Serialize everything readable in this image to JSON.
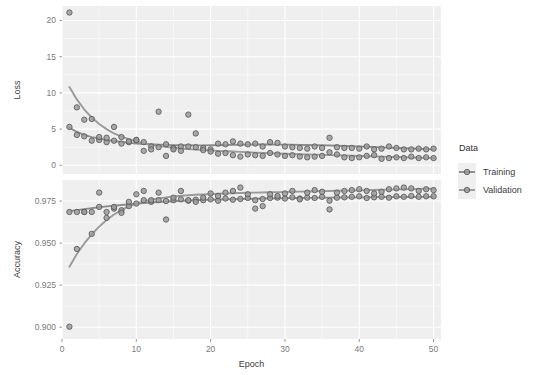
{
  "chart_data": {
    "type": "scatter",
    "title": "",
    "subtitle": "",
    "xlabel": "Epoch",
    "grid": true,
    "legend_position": "right",
    "legend_title": "Data",
    "series_names": [
      "Training",
      "Validation"
    ],
    "series_colors": [
      "#8c8c8c",
      "#9a9a9a"
    ],
    "point_fill": "#9b9b9b",
    "point_stroke": "#5a5a5a",
    "panel_background": "#efefef",
    "grid_color": "#ffffff",
    "x": [
      1,
      2,
      3,
      4,
      5,
      6,
      7,
      8,
      9,
      10,
      11,
      12,
      13,
      14,
      15,
      16,
      17,
      18,
      19,
      20,
      21,
      22,
      23,
      24,
      25,
      26,
      27,
      28,
      29,
      30,
      31,
      32,
      33,
      34,
      35,
      36,
      37,
      38,
      39,
      40,
      41,
      42,
      43,
      44,
      45,
      46,
      47,
      48,
      49,
      50
    ],
    "xlim": [
      0,
      51
    ],
    "xticks": [
      0,
      10,
      20,
      30,
      40,
      50
    ],
    "xticklabels": [
      "0",
      "10",
      "20",
      "30",
      "40",
      "50"
    ],
    "panels": [
      {
        "ylabel": "Loss",
        "ylim": [
          -1.2,
          22.0
        ],
        "yticks": [
          0,
          5,
          10,
          15,
          20
        ],
        "yticklabels": [
          "0",
          "5",
          "10",
          "15",
          "20"
        ],
        "series": [
          {
            "name": "Training",
            "values": [
              5.3,
              4.2,
              4.0,
              3.4,
              3.5,
              3.2,
              3.4,
              3.0,
              3.2,
              3.5,
              3.2,
              2.6,
              2.5,
              2.9,
              2.4,
              2.6,
              2.6,
              2.5,
              2.4,
              2.2,
              3.0,
              2.9,
              3.3,
              3.0,
              2.9,
              3.0,
              2.6,
              3.2,
              3.1,
              2.6,
              2.5,
              2.4,
              2.3,
              2.6,
              2.4,
              3.8,
              2.5,
              2.4,
              2.4,
              2.3,
              2.6,
              2.2,
              2.3,
              2.6,
              2.4,
              2.2,
              2.2,
              2.3,
              2.2,
              2.3
            ],
            "trend": [
              5.2,
              4.6,
              4.2,
              3.9,
              3.7,
              3.5,
              3.35,
              3.22,
              3.1,
              3.02,
              2.95,
              2.9,
              2.86,
              2.82,
              2.79,
              2.77,
              2.76,
              2.75,
              2.75,
              2.76,
              2.78,
              2.8,
              2.82,
              2.84,
              2.86,
              2.87,
              2.87,
              2.87,
              2.86,
              2.85,
              2.84,
              2.82,
              2.8,
              2.78,
              2.76,
              2.73,
              2.7,
              2.67,
              2.64,
              2.6,
              2.56,
              2.52,
              2.48,
              2.44,
              2.4,
              2.36,
              2.32,
              2.28,
              2.24,
              2.2
            ]
          },
          {
            "name": "Validation",
            "values": [
              21.1,
              8.0,
              6.3,
              6.4,
              3.9,
              3.8,
              5.3,
              3.9,
              3.3,
              3.5,
              2.0,
              2.2,
              7.4,
              1.3,
              2.2,
              2.0,
              7.0,
              4.4,
              2.1,
              1.9,
              1.6,
              1.7,
              1.4,
              1.2,
              1.5,
              1.4,
              1.3,
              1.7,
              1.5,
              1.3,
              1.4,
              1.2,
              1.1,
              1.2,
              1.3,
              1.8,
              1.5,
              1.1,
              1.0,
              1.1,
              1.3,
              1.4,
              0.9,
              1.0,
              1.1,
              1.0,
              1.2,
              1.0,
              1.1,
              1.0
            ],
            "trend": [
              10.8,
              9.1,
              7.7,
              6.6,
              5.7,
              5.0,
              4.4,
              3.95,
              3.6,
              3.3,
              3.05,
              2.85,
              2.68,
              2.54,
              2.42,
              2.32,
              2.24,
              2.17,
              2.11,
              2.05,
              2.0,
              1.95,
              1.9,
              1.85,
              1.8,
              1.75,
              1.71,
              1.67,
              1.63,
              1.6,
              1.56,
              1.53,
              1.5,
              1.47,
              1.44,
              1.41,
              1.38,
              1.35,
              1.32,
              1.29,
              1.26,
              1.23,
              1.2,
              1.17,
              1.14,
              1.11,
              1.08,
              1.05,
              1.02,
              1.0
            ]
          }
        ]
      },
      {
        "ylabel": "Accuracy",
        "ylim": [
          0.893,
          0.9875
        ],
        "yticks": [
          0.9,
          0.925,
          0.95,
          0.975
        ],
        "yticklabels": [
          "0.900",
          "0.925",
          "0.950",
          "0.975"
        ],
        "series": [
          {
            "name": "Training",
            "values": [
              0.9685,
              0.9685,
              0.9685,
              0.9685,
              0.9715,
              0.9685,
              0.9705,
              0.9695,
              0.972,
              0.9735,
              0.9755,
              0.9745,
              0.9755,
              0.975,
              0.9755,
              0.976,
              0.9752,
              0.9758,
              0.9755,
              0.976,
              0.9752,
              0.9765,
              0.9758,
              0.9762,
              0.9768,
              0.9755,
              0.9762,
              0.9768,
              0.977,
              0.9765,
              0.9772,
              0.9765,
              0.977,
              0.9768,
              0.9775,
              0.9752,
              0.977,
              0.9772,
              0.9775,
              0.9778,
              0.9768,
              0.9772,
              0.9775,
              0.977,
              0.9778,
              0.9775,
              0.978,
              0.9775,
              0.9778,
              0.9778
            ],
            "trend": [
              0.969,
              0.9696,
              0.9702,
              0.9708,
              0.9713,
              0.9718,
              0.9722,
              0.9726,
              0.973,
              0.9734,
              0.9738,
              0.9741,
              0.9744,
              0.9747,
              0.9749,
              0.9751,
              0.9753,
              0.9755,
              0.9757,
              0.9758,
              0.9759,
              0.976,
              0.9761,
              0.9762,
              0.9763,
              0.9764,
              0.9765,
              0.9766,
              0.9766,
              0.9767,
              0.9768,
              0.9768,
              0.9769,
              0.9769,
              0.977,
              0.977,
              0.9771,
              0.9771,
              0.9772,
              0.9772,
              0.9772,
              0.9773,
              0.9773,
              0.9773,
              0.9774,
              0.9774,
              0.9774,
              0.9775,
              0.9775,
              0.9775
            ]
          },
          {
            "name": "Validation",
            "values": [
              0.9003,
              0.9465,
              0.9685,
              0.9555,
              0.98,
              0.965,
              0.9715,
              0.968,
              0.9745,
              0.979,
              0.981,
              0.9755,
              0.98,
              0.964,
              0.977,
              0.981,
              0.9755,
              0.9745,
              0.977,
              0.9795,
              0.978,
              0.98,
              0.981,
              0.983,
              0.979,
              0.9705,
              0.972,
              0.979,
              0.978,
              0.9795,
              0.981,
              0.976,
              0.98,
              0.9815,
              0.9805,
              0.97,
              0.98,
              0.981,
              0.9815,
              0.982,
              0.981,
              0.9795,
              0.9805,
              0.982,
              0.9825,
              0.983,
              0.9825,
              0.981,
              0.982,
              0.9815
            ],
            "trend": [
              0.936,
              0.9435,
              0.9498,
              0.9552,
              0.9598,
              0.9637,
              0.967,
              0.9697,
              0.9718,
              0.9735,
              0.9748,
              0.9758,
              0.9766,
              0.9772,
              0.9777,
              0.9781,
              0.9784,
              0.9787,
              0.9789,
              0.9791,
              0.9793,
              0.9795,
              0.9796,
              0.9798,
              0.9799,
              0.98,
              0.9801,
              0.9802,
              0.9803,
              0.9804,
              0.9805,
              0.9806,
              0.9807,
              0.9808,
              0.9809,
              0.981,
              0.9811,
              0.9812,
              0.9813,
              0.9814,
              0.9815,
              0.9816,
              0.9817,
              0.9818,
              0.9819,
              0.982,
              0.9821,
              0.9822,
              0.9823,
              0.9824
            ]
          }
        ]
      }
    ]
  },
  "legend": {
    "title": "Data",
    "items": [
      {
        "label": "Training",
        "color": "#8c8c8c"
      },
      {
        "label": "Validation",
        "color": "#9a9a9a"
      }
    ]
  },
  "axes": {
    "x_title": "Epoch",
    "panel_titles": [
      "Loss",
      "Accuracy"
    ]
  }
}
